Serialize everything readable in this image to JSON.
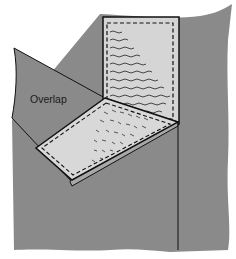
{
  "diagram": {
    "labels": {
      "overlap": "Overlap"
    },
    "colors": {
      "background_fabric": "#8a8a8a",
      "panel_fill": "#d8d8d8",
      "outline": "#111111",
      "page": "#ffffff"
    },
    "parts": [
      "background-fabric",
      "vertical-panel-with-stitching",
      "folded-flap-overlap",
      "angled-panel-with-stitching",
      "vertical-seam-line"
    ]
  }
}
